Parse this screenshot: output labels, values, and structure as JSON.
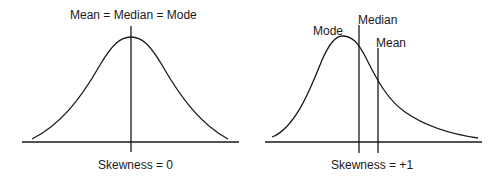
{
  "left_panel": {
    "top_label": "Mean = Median = Mode",
    "bottom_label": "Skewness = 0"
  },
  "right_panel": {
    "mode_label": "Mode",
    "median_label": "Median",
    "mean_label": "Mean",
    "bottom_label": "Skewness = +1"
  },
  "colors": {
    "stroke": "#1a1a1a",
    "background": "#ffffff"
  }
}
